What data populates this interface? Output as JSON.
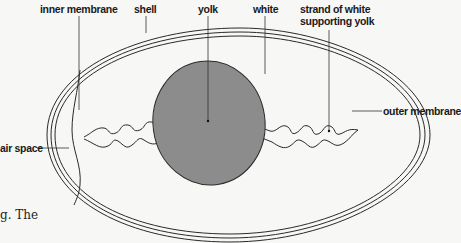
{
  "diagram": {
    "labels": {
      "inner_membrane": "inner membrane",
      "shell": "shell",
      "yolk": "yolk",
      "white": "white",
      "strand_line1": "strand of white",
      "strand_line2": "supporting yolk",
      "air_space": "air space",
      "outer_membrane": "outer membrane"
    },
    "colors": {
      "background": "#f7f7f5",
      "outline": "#2a2a2a",
      "yolk_fill": "#8c8c8c",
      "label_text": "#1a1a1a"
    }
  },
  "background_text": {
    "fragment": "g. The"
  }
}
